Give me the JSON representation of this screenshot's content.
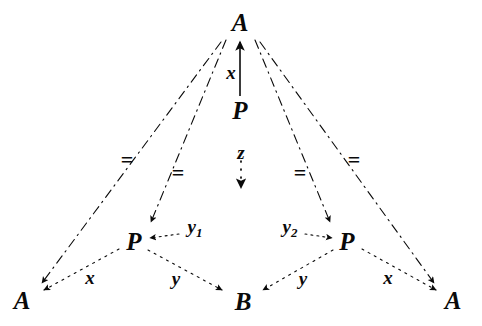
{
  "figure": {
    "kind": "commutative-diagram",
    "background_color": "#ffffff",
    "ink_color": "#0a0a0a"
  },
  "nodes": [
    {
      "id": "a-top",
      "label": "A",
      "x": 240,
      "y": 22
    },
    {
      "id": "p-top",
      "label": "P",
      "x": 240,
      "y": 110
    },
    {
      "id": "p-left",
      "label": "P",
      "x": 134,
      "y": 241
    },
    {
      "id": "p-right",
      "label": "P",
      "x": 347,
      "y": 241
    },
    {
      "id": "a-bottom-left",
      "label": "A",
      "x": 22,
      "y": 300
    },
    {
      "id": "b-bottom",
      "label": "B",
      "x": 243,
      "y": 301
    },
    {
      "id": "a-bottom-right",
      "label": "A",
      "x": 453,
      "y": 300
    }
  ],
  "edge_labels": [
    {
      "id": "x-top",
      "text": "x",
      "sub": "",
      "x": 231,
      "y": 72
    },
    {
      "id": "z-center",
      "text": "z",
      "sub": "",
      "x": 241,
      "y": 152
    },
    {
      "id": "y1",
      "text": "y",
      "sub": "1",
      "x": 195,
      "y": 228
    },
    {
      "id": "y2",
      "text": "y",
      "sub": "2",
      "x": 290,
      "y": 228
    },
    {
      "id": "x-bottom-left",
      "text": "x",
      "sub": "",
      "x": 90,
      "y": 277
    },
    {
      "id": "y-bottom-left",
      "text": "y",
      "sub": "",
      "x": 176,
      "y": 278
    },
    {
      "id": "y-bottom-right",
      "text": "y",
      "sub": "",
      "x": 303,
      "y": 278
    },
    {
      "id": "x-bottom-right",
      "text": "x",
      "sub": "",
      "x": 388,
      "y": 277
    }
  ],
  "equality_markers": [
    {
      "id": "eq-outer-left",
      "text": "=",
      "x": 127,
      "y": 160
    },
    {
      "id": "eq-inner-left",
      "text": "=",
      "x": 178,
      "y": 173
    },
    {
      "id": "eq-inner-right",
      "text": "=",
      "x": 300,
      "y": 173
    },
    {
      "id": "eq-outer-right",
      "text": "=",
      "x": 354,
      "y": 160
    }
  ],
  "edges": [
    {
      "id": "edge-p-top-to-a-top",
      "from": "p-top",
      "to": "a-top",
      "label": "x",
      "style": "solid"
    },
    {
      "id": "edge-p-top-to-z",
      "from": "p-top",
      "to": "z-center",
      "label": "z",
      "style": "dotted"
    },
    {
      "id": "edge-a-top-to-p-left",
      "from": "a-top",
      "to": "p-left",
      "label": "",
      "style": "dash-dot"
    },
    {
      "id": "edge-a-top-to-p-right",
      "from": "a-top",
      "to": "p-right",
      "label": "",
      "style": "dash-dot"
    },
    {
      "id": "edge-a-top-to-a-bottom-left",
      "from": "a-top",
      "to": "a-bottom-left",
      "label": "",
      "style": "dash-dot"
    },
    {
      "id": "edge-a-top-to-a-bottom-right",
      "from": "a-top",
      "to": "a-bottom-right",
      "label": "",
      "style": "dash-dot"
    },
    {
      "id": "edge-y1-to-p-left",
      "from": "y1",
      "to": "p-left",
      "label": "y1",
      "style": "dotted"
    },
    {
      "id": "edge-y2-to-p-right",
      "from": "y2",
      "to": "p-right",
      "label": "y2",
      "style": "dotted"
    },
    {
      "id": "edge-p-left-to-a-bottom-left",
      "from": "p-left",
      "to": "a-bottom-left",
      "label": "x",
      "style": "dotted"
    },
    {
      "id": "edge-p-left-to-b-bottom",
      "from": "p-left",
      "to": "b-bottom",
      "label": "y",
      "style": "dotted"
    },
    {
      "id": "edge-p-right-to-b-bottom",
      "from": "p-right",
      "to": "b-bottom",
      "label": "y",
      "style": "dotted"
    },
    {
      "id": "edge-p-right-to-a-bottom-right",
      "from": "p-right",
      "to": "a-bottom-right",
      "label": "x",
      "style": "dotted"
    }
  ]
}
